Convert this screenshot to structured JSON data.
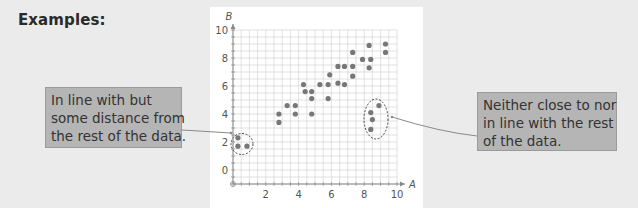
{
  "heading": "Examples:",
  "callouts": {
    "left": {
      "lines": [
        "In line with but",
        "some distance from",
        "the rest of the data."
      ]
    },
    "right": {
      "lines": [
        "Neither close to nor",
        "in line with the rest",
        "of the data."
      ]
    }
  },
  "colors": {
    "background": "#ebebeb",
    "panel": "#ffffff",
    "grid": "#cfcfcf",
    "point": "#777777",
    "callout_fill": "#b5b5b5",
    "callout_border": "#9a9a9a",
    "leader_line": "#8a8a8a"
  },
  "chart_data": {
    "type": "scatter",
    "title": "",
    "xlabel": "A",
    "ylabel": "B",
    "xlim": [
      0,
      10
    ],
    "ylim": [
      -1,
      10
    ],
    "x_ticks": [
      "2",
      "4",
      "6",
      "8",
      "10"
    ],
    "y_ticks": [
      "0",
      "2",
      "4",
      "6",
      "8",
      "10"
    ],
    "grid": true,
    "grid_minor_step": 0.5,
    "series": [
      {
        "name": "main trend",
        "points": [
          [
            2.8,
            3.4
          ],
          [
            2.8,
            4.0
          ],
          [
            3.3,
            4.6
          ],
          [
            3.8,
            4.6
          ],
          [
            3.8,
            4.0
          ],
          [
            4.3,
            6.1
          ],
          [
            4.4,
            5.6
          ],
          [
            4.8,
            5.6
          ],
          [
            4.8,
            5.1
          ],
          [
            4.8,
            4.0
          ],
          [
            5.3,
            6.1
          ],
          [
            5.8,
            6.1
          ],
          [
            5.9,
            6.8
          ],
          [
            5.8,
            5.1
          ],
          [
            6.4,
            6.2
          ],
          [
            6.4,
            7.4
          ],
          [
            6.8,
            6.1
          ],
          [
            6.8,
            7.4
          ],
          [
            7.3,
            7.4
          ],
          [
            7.3,
            6.7
          ],
          [
            7.3,
            8.4
          ],
          [
            7.9,
            7.9
          ],
          [
            8.3,
            7.3
          ],
          [
            8.4,
            7.9
          ],
          [
            8.3,
            8.9
          ],
          [
            9.3,
            9.0
          ],
          [
            9.3,
            8.4
          ]
        ]
      },
      {
        "name": "outliers in line, distant",
        "points": [
          [
            0.3,
            2.3
          ],
          [
            0.3,
            1.7
          ],
          [
            0.85,
            1.7
          ]
        ],
        "circled": true
      },
      {
        "name": "outliers not close nor in line",
        "points": [
          [
            8.9,
            4.6
          ],
          [
            8.4,
            4.1
          ],
          [
            8.5,
            3.6
          ],
          [
            8.4,
            2.9
          ]
        ],
        "circled": true
      }
    ],
    "annotations": [
      "In line with but some distance from the rest of the data.",
      "Neither close to nor in line with the rest of the data."
    ]
  }
}
